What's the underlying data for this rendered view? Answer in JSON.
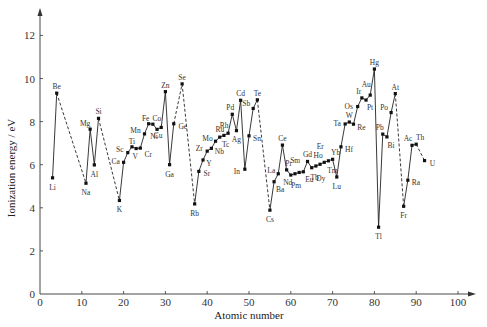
{
  "chart_data": {
    "type": "line",
    "title": "",
    "xlabel": "Atomic number",
    "ylabel": "Ionization energy / eV",
    "xlim": [
      0,
      100
    ],
    "ylim": [
      0,
      13
    ],
    "x_ticks": [
      0,
      10,
      20,
      30,
      40,
      50,
      60,
      70,
      80,
      90,
      100
    ],
    "y_ticks": [
      0,
      2,
      4,
      6,
      8,
      10,
      12
    ],
    "grid": false,
    "legend": null,
    "points": [
      {
        "z": 3,
        "symbol": "Li",
        "ie": 5.39
      },
      {
        "z": 4,
        "symbol": "Be",
        "ie": 9.32
      },
      {
        "z": 11,
        "symbol": "Na",
        "ie": 5.14
      },
      {
        "z": 12,
        "symbol": "Mg",
        "ie": 7.65
      },
      {
        "z": 13,
        "symbol": "Al",
        "ie": 5.99
      },
      {
        "z": 14,
        "symbol": "Si",
        "ie": 8.15
      },
      {
        "z": 19,
        "symbol": "K",
        "ie": 4.34
      },
      {
        "z": 20,
        "symbol": "Ca",
        "ie": 6.11
      },
      {
        "z": 21,
        "symbol": "Sc",
        "ie": 6.56
      },
      {
        "z": 22,
        "symbol": "Ti",
        "ie": 6.83
      },
      {
        "z": 23,
        "symbol": "V",
        "ie": 6.75
      },
      {
        "z": 24,
        "symbol": "Cr",
        "ie": 6.77
      },
      {
        "z": 25,
        "symbol": "Mn",
        "ie": 7.43
      },
      {
        "z": 26,
        "symbol": "Fe",
        "ie": 7.9
      },
      {
        "z": 27,
        "symbol": "Co",
        "ie": 7.88
      },
      {
        "z": 28,
        "symbol": "Ni",
        "ie": 7.64
      },
      {
        "z": 29,
        "symbol": "Cu",
        "ie": 7.73
      },
      {
        "z": 30,
        "symbol": "Zn",
        "ie": 9.39
      },
      {
        "z": 31,
        "symbol": "Ga",
        "ie": 6.0
      },
      {
        "z": 32,
        "symbol": "Ge",
        "ie": 7.9
      },
      {
        "z": 34,
        "symbol": "Se",
        "ie": 9.75
      },
      {
        "z": 37,
        "symbol": "Rb",
        "ie": 4.18
      },
      {
        "z": 38,
        "symbol": "Sr",
        "ie": 5.69
      },
      {
        "z": 39,
        "symbol": "Y",
        "ie": 6.22
      },
      {
        "z": 40,
        "symbol": "Zr",
        "ie": 6.63
      },
      {
        "z": 41,
        "symbol": "Nb",
        "ie": 6.76
      },
      {
        "z": 42,
        "symbol": "Mo",
        "ie": 7.09
      },
      {
        "z": 43,
        "symbol": "Tc",
        "ie": 7.28
      },
      {
        "z": 44,
        "symbol": "Ru",
        "ie": 7.36
      },
      {
        "z": 45,
        "symbol": "Rh",
        "ie": 7.46
      },
      {
        "z": 46,
        "symbol": "Pd",
        "ie": 8.34
      },
      {
        "z": 47,
        "symbol": "Ag",
        "ie": 7.58
      },
      {
        "z": 48,
        "symbol": "Cd",
        "ie": 8.99
      },
      {
        "z": 49,
        "symbol": "In",
        "ie": 5.79
      },
      {
        "z": 50,
        "symbol": "Sn",
        "ie": 7.34
      },
      {
        "z": 51,
        "symbol": "Sb",
        "ie": 8.61
      },
      {
        "z": 52,
        "symbol": "Te",
        "ie": 9.01
      },
      {
        "z": 55,
        "symbol": "Cs",
        "ie": 3.89
      },
      {
        "z": 56,
        "symbol": "Ba",
        "ie": 5.21
      },
      {
        "z": 57,
        "symbol": "La",
        "ie": 5.58
      },
      {
        "z": 58,
        "symbol": "Ce",
        "ie": 6.91
      },
      {
        "z": 59,
        "symbol": "Pr",
        "ie": 5.76
      },
      {
        "z": 60,
        "symbol": "Nd",
        "ie": 5.52
      },
      {
        "z": 61,
        "symbol": "Pm",
        "ie": 5.58
      },
      {
        "z": 62,
        "symbol": "Sm",
        "ie": 5.64
      },
      {
        "z": 63,
        "symbol": "Eu",
        "ie": 5.67
      },
      {
        "z": 64,
        "symbol": "Gd",
        "ie": 6.15
      },
      {
        "z": 65,
        "symbol": "Tb",
        "ie": 5.86
      },
      {
        "z": 66,
        "symbol": "Dy",
        "ie": 5.94
      },
      {
        "z": 67,
        "symbol": "Ho",
        "ie": 6.02
      },
      {
        "z": 68,
        "symbol": "Er",
        "ie": 6.11
      },
      {
        "z": 69,
        "symbol": "Tm",
        "ie": 6.18
      },
      {
        "z": 70,
        "symbol": "Yb",
        "ie": 6.25
      },
      {
        "z": 71,
        "symbol": "Lu",
        "ie": 5.43
      },
      {
        "z": 72,
        "symbol": "Hf",
        "ie": 6.83
      },
      {
        "z": 73,
        "symbol": "Ta",
        "ie": 7.89
      },
      {
        "z": 74,
        "symbol": "W",
        "ie": 7.98
      },
      {
        "z": 75,
        "symbol": "Re",
        "ie": 7.88
      },
      {
        "z": 76,
        "symbol": "Os",
        "ie": 8.7
      },
      {
        "z": 77,
        "symbol": "Ir",
        "ie": 9.1
      },
      {
        "z": 78,
        "symbol": "Pt",
        "ie": 9.0
      },
      {
        "z": 79,
        "symbol": "Au",
        "ie": 9.23
      },
      {
        "z": 80,
        "symbol": "Hg",
        "ie": 10.44
      },
      {
        "z": 81,
        "symbol": "Tl",
        "ie": 3.1
      },
      {
        "z": 82,
        "symbol": "Pb",
        "ie": 7.42
      },
      {
        "z": 83,
        "symbol": "Bi",
        "ie": 7.29
      },
      {
        "z": 84,
        "symbol": "Po",
        "ie": 8.42
      },
      {
        "z": 85,
        "symbol": "At",
        "ie": 9.3
      },
      {
        "z": 87,
        "symbol": "Fr",
        "ie": 4.07
      },
      {
        "z": 88,
        "symbol": "Ra",
        "ie": 5.28
      },
      {
        "z": 89,
        "symbol": "Ac",
        "ie": 6.9
      },
      {
        "z": 90,
        "symbol": "Th",
        "ie": 6.95
      },
      {
        "z": 92,
        "symbol": "U",
        "ie": 6.19
      }
    ],
    "dashed_links": [
      [
        4,
        11
      ],
      [
        14,
        19
      ],
      [
        32,
        34
      ],
      [
        34,
        37
      ],
      [
        52,
        55
      ],
      [
        85,
        87
      ],
      [
        90,
        92
      ]
    ],
    "label_offsets": {
      "Li": [
        0,
        10
      ],
      "Be": [
        0,
        -6
      ],
      "Na": [
        0,
        10
      ],
      "Mg": [
        -5,
        -5
      ],
      "Al": [
        0,
        10
      ],
      "Si": [
        0,
        -6
      ],
      "K": [
        0,
        10
      ],
      "Ca": [
        -8,
        0
      ],
      "Sc": [
        -8,
        -3
      ],
      "Ti": [
        0,
        -5
      ],
      "V": [
        -1,
        8
      ],
      "Cr": [
        8,
        7
      ],
      "Mn": [
        -9,
        -3
      ],
      "Fe": [
        -3,
        -5
      ],
      "Co": [
        4,
        -5
      ],
      "Ni": [
        -3,
        8
      ],
      "Cu": [
        -3,
        9
      ],
      "Zn": [
        0,
        -6
      ],
      "Ga": [
        0,
        10
      ],
      "Ge": [
        9,
        3
      ],
      "Se": [
        0,
        -6
      ],
      "Rb": [
        0,
        10
      ],
      "Sr": [
        8,
        3
      ],
      "Y": [
        6,
        4
      ],
      "Zr": [
        -8,
        -2
      ],
      "Nb": [
        8,
        4
      ],
      "Mo": [
        -8,
        -2
      ],
      "Tc": [
        6,
        8
      ],
      "Ru": [
        -4,
        -5
      ],
      "Rh": [
        -4,
        -7
      ],
      "Pd": [
        -2,
        -6
      ],
      "Ag": [
        0,
        9
      ],
      "Cd": [
        0,
        -6
      ],
      "In": [
        -8,
        3
      ],
      "Sn": [
        8,
        3
      ],
      "Sb": [
        -7,
        -4
      ],
      "Te": [
        0,
        -6
      ],
      "Cs": [
        0,
        10
      ],
      "Ba": [
        6,
        8
      ],
      "La": [
        -7,
        -3
      ],
      "Ce": [
        0,
        -6
      ],
      "Pr": [
        2,
        -6
      ],
      "Nd": [
        -3,
        8
      ],
      "Pm": [
        1,
        12
      ],
      "Sm": [
        -4,
        -11
      ],
      "Eu": [
        6,
        8
      ],
      "Gd": [
        0,
        -6
      ],
      "Tb": [
        3,
        10
      ],
      "Dy": [
        5,
        13
      ],
      "Ho": [
        -2,
        -8
      ],
      "Er": [
        -4,
        -15
      ],
      "Tm": [
        4,
        10
      ],
      "Yb": [
        3,
        -6
      ],
      "Lu": [
        0,
        10
      ],
      "Hf": [
        8,
        3
      ],
      "Ta": [
        -8,
        0
      ],
      "W": [
        0,
        -6
      ],
      "Re": [
        8,
        4
      ],
      "Os": [
        -9,
        0
      ],
      "Ir": [
        -3,
        -6
      ],
      "Pt": [
        4,
        8
      ],
      "Au": [
        -4,
        -10
      ],
      "Hg": [
        0,
        -6
      ],
      "Tl": [
        0,
        10
      ],
      "Pb": [
        -3,
        -6
      ],
      "Bi": [
        4,
        9
      ],
      "Po": [
        -7,
        -5
      ],
      "At": [
        0,
        -6
      ],
      "Fr": [
        0,
        10
      ],
      "Ra": [
        8,
        3
      ],
      "Ac": [
        -4,
        -6
      ],
      "Th": [
        4,
        -6
      ],
      "U": [
        8,
        3
      ]
    }
  }
}
